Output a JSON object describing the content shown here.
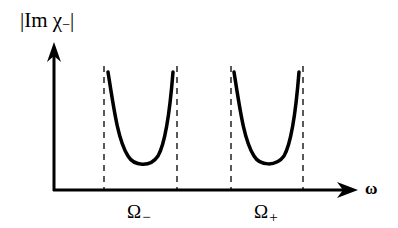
{
  "diagram": {
    "y_axis_label": {
      "prefix": "|Im ",
      "symbol": "χ",
      "subscript": "−",
      "suffix": "|"
    },
    "x_axis_label": "ω",
    "resonances": [
      {
        "label": "Ω",
        "subscript": "−"
      },
      {
        "label": "Ω",
        "subscript": "+"
      }
    ],
    "colors": {
      "stroke": "#000000",
      "background": "#ffffff"
    }
  }
}
